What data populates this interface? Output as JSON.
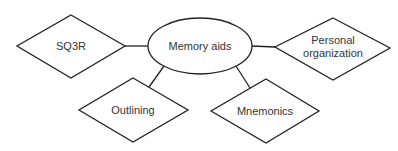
{
  "diagram": {
    "type": "concept-map",
    "center": {
      "id": "memory-aids",
      "label": "Memory aids",
      "shape": "ellipse"
    },
    "nodes": [
      {
        "id": "sq3r",
        "label": "SQ3R",
        "shape": "diamond"
      },
      {
        "id": "personal-organization",
        "label_lines": [
          "Personal",
          "organization"
        ],
        "shape": "diamond"
      },
      {
        "id": "outlining",
        "label": "Outlining",
        "shape": "diamond"
      },
      {
        "id": "mnemonics",
        "label": "Mnemonics",
        "shape": "diamond"
      }
    ],
    "edges": [
      {
        "from": "memory-aids",
        "to": "sq3r"
      },
      {
        "from": "memory-aids",
        "to": "personal-organization"
      },
      {
        "from": "memory-aids",
        "to": "outlining"
      },
      {
        "from": "memory-aids",
        "to": "mnemonics"
      }
    ],
    "colors": {
      "stroke": "#222222",
      "text": "#333333",
      "background": "#ffffff"
    }
  }
}
